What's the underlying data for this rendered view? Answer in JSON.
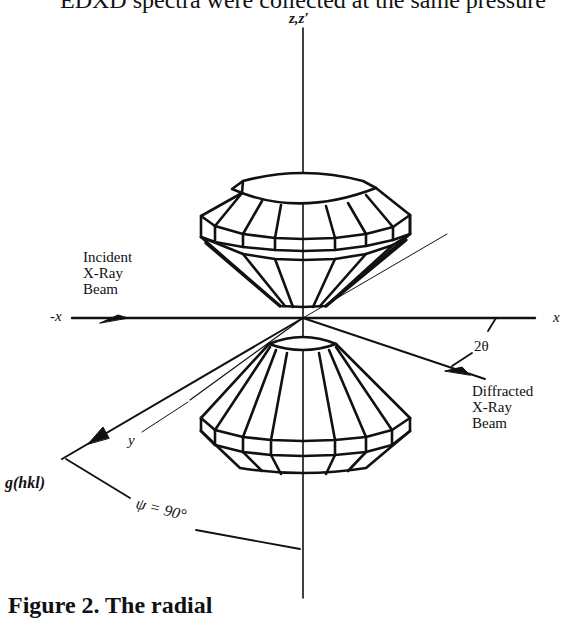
{
  "page": {
    "top_text": "EDXD spectra were collected at the same pressure",
    "caption_fragment": "Figure 2. The radial"
  },
  "diagram": {
    "axis_labels": {
      "z_axis": "z,z′",
      "neg_x": "-x",
      "pos_x": "x",
      "y_axis": "y"
    },
    "beams": {
      "incident": [
        "Incident",
        "X-Ray",
        "Beam"
      ],
      "diffracted": [
        "Diffracted",
        "X-Ray",
        "Beam"
      ]
    },
    "angles": {
      "two_theta": "2θ",
      "psi": "ψ = 90°"
    },
    "vector_label": "g(hkl)",
    "components": [
      "upper-diamond-anvil",
      "lower-diamond-anvil"
    ],
    "colors": {
      "ink": "#111111",
      "background": "#ffffff"
    }
  }
}
